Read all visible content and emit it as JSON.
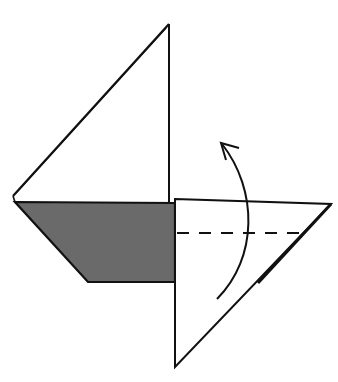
{
  "diagram": {
    "type": "origami-fold-step",
    "colors": {
      "background": "#ffffff",
      "stroke": "#111111",
      "colored_side": "#6a6a6a",
      "white_side": "#ffffff"
    },
    "parts": {
      "upper_triangle": {
        "label": "upper-left triangular flap (white)"
      },
      "colored_trapezoid": {
        "label": "lower-left colored flap"
      },
      "right_triangle": {
        "label": "right triangular flap (white)"
      },
      "valley_fold_line": {
        "label": "valley fold (dashed)"
      },
      "fold_arrow": {
        "label": "fold up arrow"
      }
    }
  }
}
